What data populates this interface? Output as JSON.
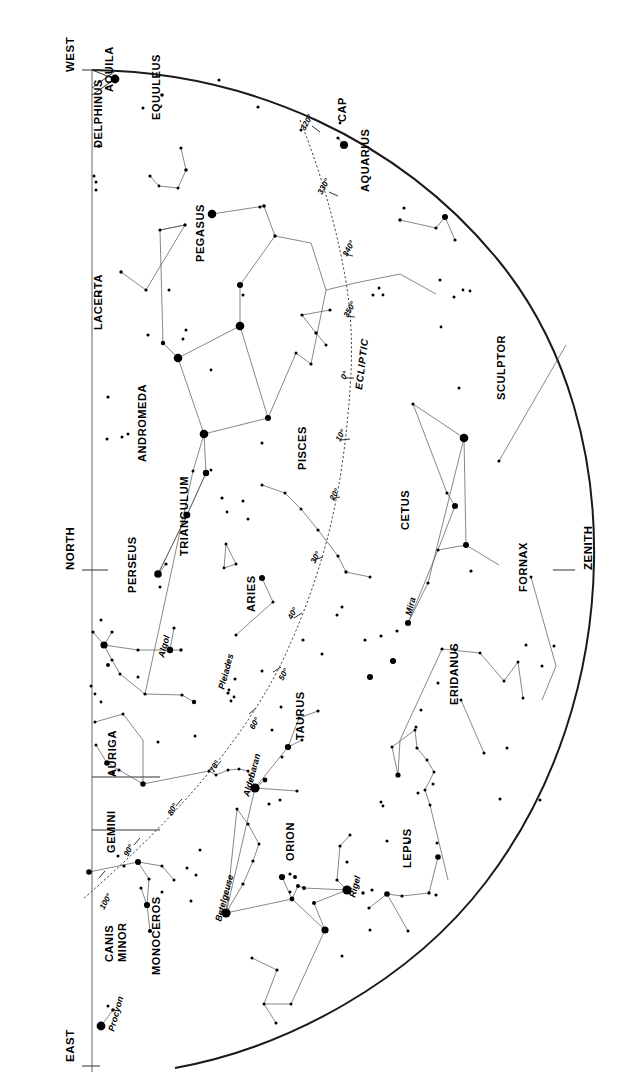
{
  "chart_title": "Night Sky Star Chart",
  "cardinals": [
    {
      "label": "WEST",
      "x": 74,
      "y": 72,
      "rot": -90
    },
    {
      "label": "NORTH",
      "x": 74,
      "y": 570,
      "rot": -90
    },
    {
      "label": "EAST",
      "x": 74,
      "y": 1062,
      "rot": -90
    },
    {
      "label": "ZENITH",
      "x": 592,
      "y": 570,
      "rot": -90
    }
  ],
  "ecliptic_label": "ECLIPTIC",
  "ecliptic_degrees": [
    {
      "label": "320°",
      "x": 305,
      "y": 131
    },
    {
      "label": "330°",
      "x": 322,
      "y": 195
    },
    {
      "label": "340°",
      "x": 347,
      "y": 257
    },
    {
      "label": "350°",
      "x": 348,
      "y": 318
    },
    {
      "label": "0°",
      "x": 345,
      "y": 380
    },
    {
      "label": "10°",
      "x": 340,
      "y": 442
    },
    {
      "label": "20°",
      "x": 334,
      "y": 501
    },
    {
      "label": "30°",
      "x": 315,
      "y": 564
    },
    {
      "label": "40°",
      "x": 292,
      "y": 620
    },
    {
      "label": "50°",
      "x": 283,
      "y": 681
    },
    {
      "label": "60°",
      "x": 254,
      "y": 730
    },
    {
      "label": "70°",
      "x": 214,
      "y": 773
    },
    {
      "label": "80°",
      "x": 172,
      "y": 816
    },
    {
      "label": "90°",
      "x": 128,
      "y": 857
    },
    {
      "label": "100°",
      "x": 104,
      "y": 910
    }
  ],
  "constellations": [
    {
      "name": "AQUILA",
      "x": 113,
      "y": 92
    },
    {
      "name": "EQUULEUS",
      "x": 160,
      "y": 120
    },
    {
      "name": "DELPHINUS",
      "x": 102,
      "y": 148
    },
    {
      "name": "CAP",
      "x": 346,
      "y": 122
    },
    {
      "name": "AQUARIUS",
      "x": 369,
      "y": 192
    },
    {
      "name": "PEGASUS",
      "x": 204,
      "y": 262
    },
    {
      "name": "LACERTA",
      "x": 102,
      "y": 330
    },
    {
      "name": "SCULPTOR",
      "x": 505,
      "y": 400
    },
    {
      "name": "PISCES",
      "x": 306,
      "y": 470
    },
    {
      "name": "ANDROMEDA",
      "x": 146,
      "y": 462
    },
    {
      "name": "CETUS",
      "x": 409,
      "y": 530
    },
    {
      "name": "TRIANGULUM",
      "x": 188,
      "y": 556
    },
    {
      "name": "PERSEUS",
      "x": 136,
      "y": 593
    },
    {
      "name": "FORNAX",
      "x": 527,
      "y": 592
    },
    {
      "name": "ARIES",
      "x": 255,
      "y": 612
    },
    {
      "name": "ERIDANUS",
      "x": 458,
      "y": 705
    },
    {
      "name": "TAURUS",
      "x": 304,
      "y": 740
    },
    {
      "name": "AURIGA",
      "x": 116,
      "y": 777
    },
    {
      "name": "GEMINI",
      "x": 115,
      "y": 853
    },
    {
      "name": "ORION",
      "x": 294,
      "y": 861
    },
    {
      "name": "LEPUS",
      "x": 411,
      "y": 868
    },
    {
      "name": "CANIS",
      "x": 113,
      "y": 962
    },
    {
      "name": "MINOR",
      "x": 126,
      "y": 962
    },
    {
      "name": "MONOCEROS",
      "x": 160,
      "y": 975
    }
  ],
  "named_stars": [
    {
      "name": "Algol",
      "x": 169,
      "y": 650,
      "lx": 164,
      "ly": 658
    },
    {
      "name": "Pleiades",
      "x": 232,
      "y": 697,
      "lx": 224,
      "ly": 690
    },
    {
      "name": "Mira",
      "x": 403,
      "y": 623,
      "lx": 411,
      "ly": 616
    },
    {
      "name": "Aldebaran",
      "x": 254,
      "y": 788,
      "lx": 249,
      "ly": 797
    },
    {
      "name": "Betelgeuse",
      "x": 229,
      "y": 913,
      "lx": 221,
      "ly": 922
    },
    {
      "name": "Rigel",
      "x": 347,
      "y": 890,
      "lx": 355,
      "ly": 898
    },
    {
      "name": "Procyon",
      "x": 101,
      "y": 1027,
      "lx": 114,
      "ly": 1032
    }
  ],
  "stars": [
    {
      "x": 115,
      "y": 79,
      "r": 4.4
    },
    {
      "x": 219,
      "y": 80,
      "r": 1.6
    },
    {
      "x": 258,
      "y": 107,
      "r": 1.6
    },
    {
      "x": 162,
      "y": 95,
      "r": 1.8
    },
    {
      "x": 143,
      "y": 108,
      "r": 1.5
    },
    {
      "x": 99,
      "y": 146,
      "r": 1.7
    },
    {
      "x": 94,
      "y": 176,
      "r": 1.5
    },
    {
      "x": 96,
      "y": 182,
      "r": 1.5
    },
    {
      "x": 96,
      "y": 190,
      "r": 1.5
    },
    {
      "x": 344,
      "y": 145,
      "r": 4.0
    },
    {
      "x": 338,
      "y": 138,
      "r": 1.6
    },
    {
      "x": 340,
      "y": 123,
      "r": 1.4
    },
    {
      "x": 301,
      "y": 130,
      "r": 1.5
    },
    {
      "x": 181,
      "y": 148,
      "r": 1.6
    },
    {
      "x": 186,
      "y": 170,
      "r": 1.8
    },
    {
      "x": 150,
      "y": 176,
      "r": 1.6
    },
    {
      "x": 159,
      "y": 186,
      "r": 1.4
    },
    {
      "x": 178,
      "y": 188,
      "r": 1.5
    },
    {
      "x": 212,
      "y": 214,
      "r": 4.3
    },
    {
      "x": 264,
      "y": 206,
      "r": 1.8
    },
    {
      "x": 275,
      "y": 236,
      "r": 1.7
    },
    {
      "x": 185,
      "y": 225,
      "r": 1.7
    },
    {
      "x": 160,
      "y": 230,
      "r": 1.6
    },
    {
      "x": 240,
      "y": 285,
      "r": 3.0
    },
    {
      "x": 243,
      "y": 295,
      "r": 1.5
    },
    {
      "x": 260,
      "y": 207,
      "r": 1.6
    },
    {
      "x": 240,
      "y": 326,
      "r": 4.3
    },
    {
      "x": 178,
      "y": 358,
      "r": 4.3
    },
    {
      "x": 163,
      "y": 343,
      "r": 2.2
    },
    {
      "x": 148,
      "y": 335,
      "r": 1.6
    },
    {
      "x": 186,
      "y": 330,
      "r": 1.5
    },
    {
      "x": 183,
      "y": 339,
      "r": 1.5
    },
    {
      "x": 211,
      "y": 370,
      "r": 1.4
    },
    {
      "x": 146,
      "y": 290,
      "r": 1.6
    },
    {
      "x": 169,
      "y": 290,
      "r": 1.5
    },
    {
      "x": 121,
      "y": 272,
      "r": 1.7
    },
    {
      "x": 100,
      "y": 292,
      "r": 1.6
    },
    {
      "x": 108,
      "y": 397,
      "r": 1.6
    },
    {
      "x": 128,
      "y": 434,
      "r": 1.5
    },
    {
      "x": 122,
      "y": 437,
      "r": 1.5
    },
    {
      "x": 107,
      "y": 439,
      "r": 1.5
    },
    {
      "x": 204,
      "y": 434,
      "r": 4.3
    },
    {
      "x": 268,
      "y": 418,
      "r": 3.0
    },
    {
      "x": 262,
      "y": 443,
      "r": 1.5
    },
    {
      "x": 206,
      "y": 473,
      "r": 3.2
    },
    {
      "x": 211,
      "y": 470,
      "r": 1.5
    },
    {
      "x": 193,
      "y": 471,
      "r": 1.5
    },
    {
      "x": 187,
      "y": 515,
      "r": 3.3
    },
    {
      "x": 158,
      "y": 574,
      "r": 3.8
    },
    {
      "x": 166,
      "y": 564,
      "r": 1.6
    },
    {
      "x": 160,
      "y": 587,
      "r": 1.5
    },
    {
      "x": 316,
      "y": 333,
      "r": 1.7
    },
    {
      "x": 302,
      "y": 315,
      "r": 1.6
    },
    {
      "x": 330,
      "y": 310,
      "r": 1.6
    },
    {
      "x": 326,
      "y": 345,
      "r": 1.5
    },
    {
      "x": 296,
      "y": 353,
      "r": 1.5
    },
    {
      "x": 311,
      "y": 364,
      "r": 1.6
    },
    {
      "x": 373,
      "y": 295,
      "r": 1.5
    },
    {
      "x": 379,
      "y": 288,
      "r": 1.5
    },
    {
      "x": 383,
      "y": 295,
      "r": 1.4
    },
    {
      "x": 400,
      "y": 220,
      "r": 1.7
    },
    {
      "x": 436,
      "y": 228,
      "r": 1.6
    },
    {
      "x": 404,
      "y": 208,
      "r": 1.6
    },
    {
      "x": 445,
      "y": 217,
      "r": 3.0
    },
    {
      "x": 455,
      "y": 240,
      "r": 1.6
    },
    {
      "x": 440,
      "y": 280,
      "r": 1.5
    },
    {
      "x": 454,
      "y": 297,
      "r": 1.5
    },
    {
      "x": 463,
      "y": 290,
      "r": 1.4
    },
    {
      "x": 470,
      "y": 291,
      "r": 1.4
    },
    {
      "x": 459,
      "y": 388,
      "r": 1.5
    },
    {
      "x": 441,
      "y": 327,
      "r": 1.4
    },
    {
      "x": 464,
      "y": 438,
      "r": 4.3
    },
    {
      "x": 413,
      "y": 404,
      "r": 1.6
    },
    {
      "x": 466,
      "y": 545,
      "r": 3.0
    },
    {
      "x": 455,
      "y": 506,
      "r": 3.0
    },
    {
      "x": 447,
      "y": 493,
      "r": 1.6
    },
    {
      "x": 438,
      "y": 550,
      "r": 1.6
    },
    {
      "x": 408,
      "y": 623,
      "r": 3.0
    },
    {
      "x": 428,
      "y": 583,
      "r": 1.6
    },
    {
      "x": 471,
      "y": 571,
      "r": 1.6
    },
    {
      "x": 499,
      "y": 461,
      "r": 1.6
    },
    {
      "x": 531,
      "y": 577,
      "r": 1.5
    },
    {
      "x": 526,
      "y": 645,
      "r": 1.5
    },
    {
      "x": 542,
      "y": 666,
      "r": 1.5
    },
    {
      "x": 554,
      "y": 646,
      "r": 1.5
    },
    {
      "x": 222,
      "y": 498,
      "r": 1.6
    },
    {
      "x": 243,
      "y": 501,
      "r": 1.5
    },
    {
      "x": 248,
      "y": 519,
      "r": 1.5
    },
    {
      "x": 227,
      "y": 512,
      "r": 1.4
    },
    {
      "x": 262,
      "y": 485,
      "r": 1.5
    },
    {
      "x": 285,
      "y": 493,
      "r": 1.5
    },
    {
      "x": 301,
      "y": 509,
      "r": 1.5
    },
    {
      "x": 318,
      "y": 530,
      "r": 1.6
    },
    {
      "x": 338,
      "y": 556,
      "r": 1.6
    },
    {
      "x": 346,
      "y": 572,
      "r": 1.7
    },
    {
      "x": 370,
      "y": 577,
      "r": 1.5
    },
    {
      "x": 226,
      "y": 544,
      "r": 1.5
    },
    {
      "x": 236,
      "y": 564,
      "r": 1.5
    },
    {
      "x": 224,
      "y": 568,
      "r": 1.4
    },
    {
      "x": 262,
      "y": 578,
      "r": 3.0
    },
    {
      "x": 273,
      "y": 602,
      "r": 1.5
    },
    {
      "x": 236,
      "y": 635,
      "r": 1.5
    },
    {
      "x": 101,
      "y": 620,
      "r": 1.5
    },
    {
      "x": 93,
      "y": 632,
      "r": 1.6
    },
    {
      "x": 112,
      "y": 632,
      "r": 1.6
    },
    {
      "x": 104,
      "y": 645,
      "r": 3.6
    },
    {
      "x": 112,
      "y": 660,
      "r": 1.6
    },
    {
      "x": 108,
      "y": 665,
      "r": 2.0
    },
    {
      "x": 170,
      "y": 650,
      "r": 3.2
    },
    {
      "x": 181,
      "y": 650,
      "r": 1.7
    },
    {
      "x": 174,
      "y": 628,
      "r": 1.6
    },
    {
      "x": 138,
      "y": 650,
      "r": 1.6
    },
    {
      "x": 120,
      "y": 674,
      "r": 1.5
    },
    {
      "x": 138,
      "y": 677,
      "r": 1.5
    },
    {
      "x": 145,
      "y": 694,
      "r": 1.6
    },
    {
      "x": 182,
      "y": 695,
      "r": 1.6
    },
    {
      "x": 194,
      "y": 702,
      "r": 2.2
    },
    {
      "x": 91,
      "y": 686,
      "r": 1.5
    },
    {
      "x": 95,
      "y": 694,
      "r": 1.4
    },
    {
      "x": 101,
      "y": 702,
      "r": 1.4
    },
    {
      "x": 228,
      "y": 693,
      "r": 1.6
    },
    {
      "x": 234,
      "y": 697,
      "r": 1.4
    },
    {
      "x": 231,
      "y": 701,
      "r": 1.4
    },
    {
      "x": 229,
      "y": 690,
      "r": 1.4
    },
    {
      "x": 235,
      "y": 679,
      "r": 1.5
    },
    {
      "x": 262,
      "y": 671,
      "r": 1.5
    },
    {
      "x": 195,
      "y": 736,
      "r": 1.5
    },
    {
      "x": 209,
      "y": 771,
      "r": 1.5
    },
    {
      "x": 216,
      "y": 775,
      "r": 1.5
    },
    {
      "x": 248,
      "y": 771,
      "r": 1.5
    },
    {
      "x": 239,
      "y": 769,
      "r": 1.5
    },
    {
      "x": 228,
      "y": 770,
      "r": 1.5
    },
    {
      "x": 255,
      "y": 788,
      "r": 4.6
    },
    {
      "x": 265,
      "y": 780,
      "r": 2.4
    },
    {
      "x": 288,
      "y": 747,
      "r": 3.1
    },
    {
      "x": 299,
      "y": 718,
      "r": 1.6
    },
    {
      "x": 318,
      "y": 711,
      "r": 1.6
    },
    {
      "x": 281,
      "y": 707,
      "r": 1.5
    },
    {
      "x": 272,
      "y": 730,
      "r": 1.5
    },
    {
      "x": 282,
      "y": 757,
      "r": 1.5
    },
    {
      "x": 302,
      "y": 740,
      "r": 1.5
    },
    {
      "x": 280,
      "y": 800,
      "r": 1.5
    },
    {
      "x": 297,
      "y": 791,
      "r": 1.6
    },
    {
      "x": 269,
      "y": 804,
      "r": 1.6
    },
    {
      "x": 107,
      "y": 763,
      "r": 2.8
    },
    {
      "x": 96,
      "y": 745,
      "r": 1.5
    },
    {
      "x": 119,
      "y": 770,
      "r": 1.6
    },
    {
      "x": 113,
      "y": 773,
      "r": 1.8
    },
    {
      "x": 143,
      "y": 784,
      "r": 2.7
    },
    {
      "x": 95,
      "y": 722,
      "r": 1.5
    },
    {
      "x": 123,
      "y": 714,
      "r": 1.5
    },
    {
      "x": 158,
      "y": 742,
      "r": 1.5
    },
    {
      "x": 138,
      "y": 862,
      "r": 3.0
    },
    {
      "x": 149,
      "y": 879,
      "r": 1.6
    },
    {
      "x": 118,
      "y": 856,
      "r": 1.5
    },
    {
      "x": 89,
      "y": 872,
      "r": 2.8
    },
    {
      "x": 141,
      "y": 888,
      "r": 1.6
    },
    {
      "x": 147,
      "y": 905,
      "r": 3.1
    },
    {
      "x": 150,
      "y": 931,
      "r": 2.1
    },
    {
      "x": 124,
      "y": 866,
      "r": 1.6
    },
    {
      "x": 162,
      "y": 866,
      "r": 1.6
    },
    {
      "x": 174,
      "y": 880,
      "r": 1.5
    },
    {
      "x": 187,
      "y": 868,
      "r": 1.5
    },
    {
      "x": 162,
      "y": 892,
      "r": 1.5
    },
    {
      "x": 101,
      "y": 1026,
      "r": 4.4
    },
    {
      "x": 113,
      "y": 1010,
      "r": 1.8
    },
    {
      "x": 108,
      "y": 1006,
      "r": 1.5
    },
    {
      "x": 196,
      "y": 875,
      "r": 1.5
    },
    {
      "x": 200,
      "y": 850,
      "r": 1.5
    },
    {
      "x": 191,
      "y": 901,
      "r": 1.5
    },
    {
      "x": 226,
      "y": 913,
      "r": 4.6
    },
    {
      "x": 243,
      "y": 884,
      "r": 1.6
    },
    {
      "x": 253,
      "y": 861,
      "r": 1.6
    },
    {
      "x": 259,
      "y": 844,
      "r": 1.5
    },
    {
      "x": 248,
      "y": 824,
      "r": 1.5
    },
    {
      "x": 237,
      "y": 809,
      "r": 1.5
    },
    {
      "x": 282,
      "y": 877,
      "r": 3.1
    },
    {
      "x": 290,
      "y": 874,
      "r": 1.6
    },
    {
      "x": 295,
      "y": 877,
      "r": 2.0
    },
    {
      "x": 298,
      "y": 886,
      "r": 2.0
    },
    {
      "x": 304,
      "y": 888,
      "r": 2.0
    },
    {
      "x": 290,
      "y": 892,
      "r": 1.5
    },
    {
      "x": 292,
      "y": 899,
      "r": 2.4
    },
    {
      "x": 314,
      "y": 903,
      "r": 2.0
    },
    {
      "x": 325,
      "y": 930,
      "r": 3.6
    },
    {
      "x": 347,
      "y": 890,
      "r": 4.6
    },
    {
      "x": 337,
      "y": 880,
      "r": 1.6
    },
    {
      "x": 363,
      "y": 893,
      "r": 1.7
    },
    {
      "x": 372,
      "y": 890,
      "r": 1.6
    },
    {
      "x": 369,
      "y": 908,
      "r": 1.6
    },
    {
      "x": 370,
      "y": 930,
      "r": 1.5
    },
    {
      "x": 342,
      "y": 956,
      "r": 1.5
    },
    {
      "x": 347,
      "y": 862,
      "r": 1.6
    },
    {
      "x": 340,
      "y": 846,
      "r": 1.6
    },
    {
      "x": 350,
      "y": 835,
      "r": 1.5
    },
    {
      "x": 387,
      "y": 894,
      "r": 2.8
    },
    {
      "x": 402,
      "y": 896,
      "r": 1.6
    },
    {
      "x": 408,
      "y": 931,
      "r": 1.5
    },
    {
      "x": 429,
      "y": 893,
      "r": 1.7
    },
    {
      "x": 436,
      "y": 895,
      "r": 1.6
    },
    {
      "x": 438,
      "y": 857,
      "r": 2.8
    },
    {
      "x": 409,
      "y": 842,
      "r": 1.5
    },
    {
      "x": 437,
      "y": 843,
      "r": 1.5
    },
    {
      "x": 387,
      "y": 841,
      "r": 1.5
    },
    {
      "x": 252,
      "y": 958,
      "r": 1.5
    },
    {
      "x": 277,
      "y": 970,
      "r": 1.6
    },
    {
      "x": 264,
      "y": 1004,
      "r": 1.5
    },
    {
      "x": 291,
      "y": 1004,
      "r": 1.5
    },
    {
      "x": 276,
      "y": 1023,
      "r": 1.5
    },
    {
      "x": 442,
      "y": 649,
      "r": 1.6
    },
    {
      "x": 455,
      "y": 650,
      "r": 1.5
    },
    {
      "x": 480,
      "y": 653,
      "r": 1.5
    },
    {
      "x": 504,
      "y": 681,
      "r": 1.5
    },
    {
      "x": 518,
      "y": 662,
      "r": 1.5
    },
    {
      "x": 416,
      "y": 727,
      "r": 1.5
    },
    {
      "x": 417,
      "y": 748,
      "r": 1.6
    },
    {
      "x": 421,
      "y": 710,
      "r": 1.5
    },
    {
      "x": 427,
      "y": 760,
      "r": 1.5
    },
    {
      "x": 434,
      "y": 772,
      "r": 1.5
    },
    {
      "x": 425,
      "y": 790,
      "r": 1.5
    },
    {
      "x": 430,
      "y": 805,
      "r": 1.5
    },
    {
      "x": 418,
      "y": 793,
      "r": 1.5
    },
    {
      "x": 433,
      "y": 784,
      "r": 1.5
    },
    {
      "x": 398,
      "y": 775,
      "r": 2.6
    },
    {
      "x": 392,
      "y": 747,
      "r": 1.5
    },
    {
      "x": 415,
      "y": 730,
      "r": 1.5
    },
    {
      "x": 438,
      "y": 683,
      "r": 1.5
    },
    {
      "x": 381,
      "y": 802,
      "r": 1.5
    },
    {
      "x": 383,
      "y": 806,
      "r": 1.4
    },
    {
      "x": 461,
      "y": 700,
      "r": 1.5
    },
    {
      "x": 523,
      "y": 698,
      "r": 1.5
    },
    {
      "x": 484,
      "y": 753,
      "r": 1.5
    },
    {
      "x": 507,
      "y": 748,
      "r": 1.5
    },
    {
      "x": 500,
      "y": 799,
      "r": 1.5
    },
    {
      "x": 540,
      "y": 800,
      "r": 1.5
    },
    {
      "x": 303,
      "y": 640,
      "r": 1.6
    },
    {
      "x": 322,
      "y": 654,
      "r": 1.5
    },
    {
      "x": 365,
      "y": 640,
      "r": 1.6
    },
    {
      "x": 370,
      "y": 677,
      "r": 3.0
    },
    {
      "x": 393,
      "y": 661,
      "r": 3.0
    },
    {
      "x": 381,
      "y": 636,
      "r": 1.6
    },
    {
      "x": 397,
      "y": 631,
      "r": 1.6
    },
    {
      "x": 337,
      "y": 615,
      "r": 1.5
    },
    {
      "x": 342,
      "y": 607,
      "r": 1.5
    }
  ],
  "legend": {
    "ecliptic_note": "ECLIPTIC",
    "units": "degrees of ecliptic longitude"
  }
}
